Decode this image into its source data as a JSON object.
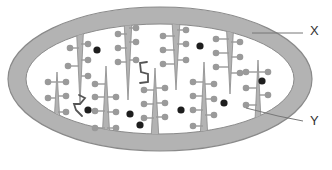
{
  "diagram": {
    "labels": [
      {
        "id": "X",
        "text": "X",
        "pointer_from": [
          252,
          33
        ],
        "pointer_to": [
          303,
          33
        ],
        "text_pos": [
          310,
          24
        ]
      },
      {
        "id": "Y",
        "text": "Y",
        "pointer_from": [
          246,
          108
        ],
        "pointer_to": [
          303,
          121
        ],
        "text_pos": [
          310,
          114
        ]
      }
    ],
    "colors": {
      "membrane_fill": "#b3b3b3",
      "membrane_stroke": "#8c8c8c",
      "matrix_fill": "#ffffff",
      "particle": "#9a9a9a",
      "granule": "#1e1e1e",
      "dna": "#555555",
      "pointer_line": "#777777"
    }
  }
}
